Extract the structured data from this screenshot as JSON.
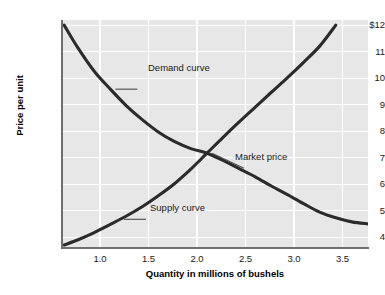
{
  "chart_data": {
    "type": "line",
    "title": "",
    "xlabel": "Quantity in millions of bushels",
    "ylabel": "Price per unit",
    "xlim": [
      0.65,
      3.5
    ],
    "ylim": [
      3.3,
      12.2
    ],
    "xticks": [
      "1.0",
      "1.5",
      "2.0",
      "2.5",
      "3.0",
      "3.5"
    ],
    "xtick_values": [
      1.0,
      1.5,
      2.0,
      2.5,
      3.0,
      3.5
    ],
    "yticks": [
      "$12",
      "11",
      "10",
      "9",
      "8",
      "7",
      "6",
      "5",
      "4"
    ],
    "ytick_values": [
      12,
      11,
      10,
      9,
      8,
      7,
      6,
      5,
      4
    ],
    "grid": true,
    "grid_color": "#ffffff",
    "plot_background": "#e7e7e7",
    "curve_color": "#2b2b2b",
    "legend_position": "inline-annotations",
    "series": [
      {
        "name": "Demand curve",
        "type": "line",
        "points": [
          [
            0.67,
            12.0
          ],
          [
            0.8,
            11.1
          ],
          [
            0.95,
            10.2
          ],
          [
            1.1,
            9.5
          ],
          [
            1.25,
            8.85
          ],
          [
            1.4,
            8.3
          ],
          [
            1.55,
            7.82
          ],
          [
            1.7,
            7.45
          ],
          [
            1.85,
            7.18
          ],
          [
            2.0,
            7.0
          ],
          [
            2.15,
            6.72
          ],
          [
            2.3,
            6.4
          ],
          [
            2.45,
            6.08
          ],
          [
            2.6,
            5.72
          ],
          [
            2.75,
            5.38
          ],
          [
            2.9,
            5.03
          ],
          [
            3.05,
            4.7
          ],
          [
            3.2,
            4.48
          ],
          [
            3.35,
            4.32
          ],
          [
            3.5,
            4.24
          ]
        ]
      },
      {
        "name": "Supply curve",
        "type": "line",
        "points": [
          [
            0.67,
            3.42
          ],
          [
            0.8,
            3.62
          ],
          [
            0.95,
            3.9
          ],
          [
            1.1,
            4.22
          ],
          [
            1.25,
            4.55
          ],
          [
            1.4,
            4.92
          ],
          [
            1.55,
            5.35
          ],
          [
            1.7,
            5.82
          ],
          [
            1.85,
            6.38
          ],
          [
            2.0,
            7.0
          ],
          [
            2.15,
            7.62
          ],
          [
            2.3,
            8.22
          ],
          [
            2.45,
            8.8
          ],
          [
            2.6,
            9.38
          ],
          [
            2.75,
            9.95
          ],
          [
            2.9,
            10.55
          ],
          [
            3.05,
            11.18
          ],
          [
            3.2,
            12.0
          ]
        ]
      }
    ],
    "annotations": [
      {
        "label": "Demand curve",
        "x": 1.1,
        "y": 9.5,
        "note": "leader line to demand curve"
      },
      {
        "label": "Market price",
        "x": 2.0,
        "y": 7.0,
        "note": "equilibrium intersection point"
      },
      {
        "label": "Supply curve",
        "x": 1.18,
        "y": 4.42,
        "note": "leader line to supply curve"
      }
    ]
  },
  "axis": {
    "ylabel": "Price per unit",
    "xlabel": "Quantity in millions of bushels",
    "yticks": [
      {
        "label": "$12"
      },
      {
        "label": "11"
      },
      {
        "label": "10"
      },
      {
        "label": "9"
      },
      {
        "label": "8"
      },
      {
        "label": "7"
      },
      {
        "label": "6"
      },
      {
        "label": "5"
      },
      {
        "label": "4"
      }
    ],
    "xticks": [
      {
        "label": "1.0"
      },
      {
        "label": "1.5"
      },
      {
        "label": "2.0"
      },
      {
        "label": "2.5"
      },
      {
        "label": "3.0"
      },
      {
        "label": "3.5"
      }
    ]
  },
  "annotations": {
    "demand": "Demand curve",
    "market": "Market price",
    "supply": "Supply curve"
  }
}
